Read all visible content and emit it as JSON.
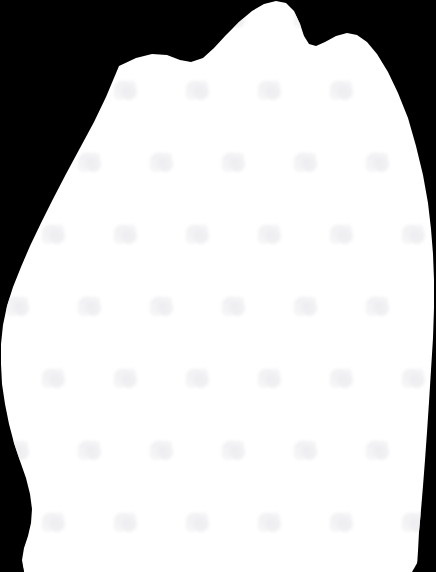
{
  "image": {
    "kind": "segmentation-mask",
    "width": 436,
    "height": 572,
    "background_color": "#000000",
    "foreground_color": "#FFFFFF",
    "title": "White organic blob silhouette on black background",
    "description": "A single large irregular white region occupying most of the frame, with a bumpy lobed upper contour and smooth rounded left, right and lower edges. Black background fills the upper-left corner, upper-right corner and a thin wedge at the lower-left and lower-right corners."
  },
  "shape": {
    "name": "blob-silhouette",
    "fill": "#FFFFFF",
    "outline_points": "119,66 136,58 152,54 167,55 180,60 191,62 203,58 214,48 226,35 239,22 252,11 264,4 276,1 286,3 294,11 300,24 304,36 309,44 316,46 325,42 336,36 347,33 357,35 367,42 377,54 388,72 398,93 408,118 416,146 423,175 428,203 431,229 433,254 434,280 434,308 433,338 431,370 429,402 427,432 425,460 423,486 421,510 419,532 418,551 417,566 417,572 24,572 22,560 24,548 28,536 31,523 32,509 30,494 26,478 20,461 14,443 9,424 5,404 2,384 1,364 1,344 3,325 7,306 13,287 21,267 30,246 41,223 53,199 66,174 80,148 94,122 106,97",
    "corner_black_wedges": [
      {
        "name": "bottom-right-wedge",
        "points": "436,530 436,572 412,572"
      },
      {
        "name": "bottom-left-wedge",
        "points": "0,470 24,572 0,572"
      }
    ]
  },
  "watermark": {
    "name": "faint-repeating-blob-marks",
    "color": "#F2F2F4",
    "opacity": 0.85,
    "tile_width": 72,
    "tile_height": 72,
    "stagger_x": 36,
    "mark_size": 26,
    "note": "Barely visible light-grey smudge marks arranged on a staggered diagonal grid inside the white silhouette."
  },
  "metrics": {
    "canvas_width_label": "436",
    "canvas_height_label": "572",
    "foreground_hex_label": "#FFFFFF",
    "background_hex_label": "#000000"
  }
}
